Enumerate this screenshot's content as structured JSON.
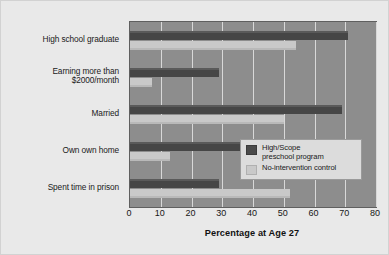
{
  "chart_data": {
    "type": "bar",
    "orientation": "horizontal",
    "title": "",
    "xlabel": "Percentage at Age 27",
    "ylabel": "",
    "xlim": [
      0,
      80
    ],
    "xticks": [
      0,
      10,
      20,
      30,
      40,
      50,
      60,
      70,
      80
    ],
    "grid": true,
    "legend_position": "inside-right",
    "categories": [
      "High school graduate",
      "Earning more than $2000/month",
      "Married",
      "Own own home",
      "Spent time in prison"
    ],
    "category_lines": [
      [
        "High school graduate",
        ""
      ],
      [
        "Earning more than",
        "$2000/month"
      ],
      [
        "Married",
        ""
      ],
      [
        "Own own home",
        ""
      ],
      [
        "Spent time in prison",
        ""
      ]
    ],
    "series": [
      {
        "name": "High/Scope preschool program",
        "color": "#464646",
        "values": [
          71,
          29,
          69,
          36,
          29
        ]
      },
      {
        "name": "No-intervention control",
        "color": "#c9c9c9",
        "values": [
          54,
          7,
          50,
          13,
          52
        ]
      }
    ]
  },
  "legend": {
    "entries": [
      {
        "line1": "High/Scope",
        "line2": "preschool program",
        "swatch": "dark"
      },
      {
        "line1": "No-intervention control",
        "line2": "",
        "swatch": "light"
      }
    ]
  },
  "axis": {
    "x_title": "Percentage at Age 27",
    "tick_labels": [
      "0",
      "10",
      "20",
      "30",
      "40",
      "50",
      "60",
      "70",
      "80"
    ]
  },
  "colors": {
    "page_background": "#e9e9e9",
    "plot_background": "#8d8d8d",
    "gridline": "#d8d8d8",
    "series_dark": "#464646",
    "series_light": "#c9c9c9",
    "legend_background": "#dcdcdc",
    "text": "#1a1a1a"
  }
}
